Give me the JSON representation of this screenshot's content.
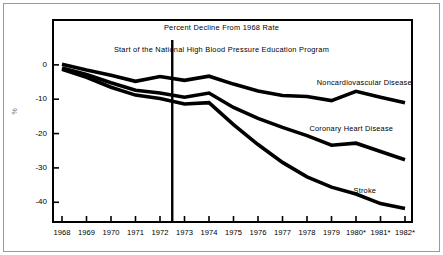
{
  "figure": {
    "title": "Percent Decline From 1968 Rate",
    "program_note": "Start of the National High Blood Pressure Education Program",
    "y_axis_title": "%"
  },
  "chart_data": {
    "type": "line",
    "title": "Percent Decline From 1968 Rate",
    "subtitle": "Start of the National High Blood Pressure Education Program",
    "xlabel": "",
    "ylabel": "%",
    "xlim": [
      1968,
      1982
    ],
    "ylim": [
      -44,
      2
    ],
    "yticks": [
      0,
      -10,
      -20,
      -30,
      -40
    ],
    "ytick_labels": [
      "0",
      "-10",
      "-20",
      "-30",
      "-40"
    ],
    "x": [
      1968,
      1969,
      1970,
      1971,
      1972,
      1973,
      1974,
      1975,
      1976,
      1977,
      1978,
      1979,
      1980,
      1981,
      1982
    ],
    "xtick_labels": [
      "1968",
      "1969",
      "1970",
      "1971",
      "1972",
      "1973",
      "1974",
      "1975",
      "1976",
      "1977",
      "1978",
      "1979",
      "1980*",
      "1981*",
      "1982*"
    ],
    "grid": false,
    "legend_position": "inline-right",
    "annotations": [
      {
        "type": "vline",
        "x": 1972.5,
        "label": "Start of the National High Blood Pressure Education Program"
      }
    ],
    "series": [
      {
        "name": "Noncardiovascular Disease",
        "values": [
          0.2,
          -1.5,
          -3.0,
          -4.8,
          -3.4,
          -4.5,
          -3.3,
          -5.6,
          -7.6,
          -8.9,
          -9.2,
          -10.4,
          -7.7,
          -9.4,
          -11.0
        ],
        "label_x": 1978.4,
        "label_y": -5.4
      },
      {
        "name": "Coronary Heart Disease",
        "values": [
          -0.9,
          -2.8,
          -5.2,
          -7.4,
          -8.2,
          -9.4,
          -8.2,
          -12.4,
          -15.6,
          -18.2,
          -20.6,
          -23.4,
          -22.8,
          -25.2,
          -27.6
        ],
        "label_x": 1978.1,
        "label_y": -18.6
      },
      {
        "name": "Stroke",
        "values": [
          -1.3,
          -3.6,
          -6.5,
          -8.8,
          -9.8,
          -11.4,
          -11.0,
          -17.4,
          -23.2,
          -28.4,
          -32.6,
          -35.6,
          -37.6,
          -40.4,
          -41.8
        ],
        "label_x": 1979.9,
        "label_y": -36.6
      }
    ]
  }
}
